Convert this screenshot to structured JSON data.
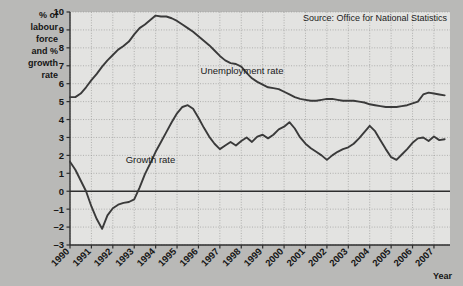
{
  "chart_data": {
    "type": "line",
    "title": "",
    "source": "Source: Office for National Statistics",
    "xlabel": "Year",
    "ylabel": "% of labour force and % growth rate",
    "ylabel_lines": [
      "% of",
      "labour",
      "force",
      "and %",
      "growth",
      "rate"
    ],
    "xlim": [
      1990,
      2007.75
    ],
    "ylim": [
      -3,
      10
    ],
    "yticks": [
      -3,
      -2,
      -1,
      0,
      1,
      2,
      3,
      4,
      5,
      6,
      7,
      8,
      9,
      10
    ],
    "ytick_labels": [
      "–3",
      "–2",
      "–1",
      "0",
      "1",
      "2",
      "3",
      "4",
      "5",
      "6",
      "7",
      "8",
      "9",
      "10"
    ],
    "xticks": [
      1990,
      1991,
      1992,
      1993,
      1994,
      1995,
      1996,
      1997,
      1998,
      1999,
      2000,
      2001,
      2002,
      2003,
      2004,
      2005,
      2006,
      2007
    ],
    "xtick_labels": [
      "1990",
      "1991",
      "1992",
      "1993",
      "1994",
      "1995",
      "1996",
      "1997",
      "1998",
      "1999",
      "2000",
      "2001",
      "2002",
      "2003",
      "2004",
      "2005",
      "2006",
      "2007"
    ],
    "grid": true,
    "grid_style": "dotted",
    "zero_line": true,
    "legend_position": "inline-annotations",
    "line_color": "#3a3a3a",
    "plot_background": "#e3e3e1",
    "page_background": "#b9b9b7",
    "series": [
      {
        "name": "Unemployment rate",
        "label_x": 1996.1,
        "label_y": 6.55,
        "x": [
          1990.0,
          1990.25,
          1990.5,
          1990.75,
          1991.0,
          1991.25,
          1991.5,
          1991.75,
          1992.0,
          1992.25,
          1992.5,
          1992.75,
          1993.0,
          1993.25,
          1993.5,
          1993.75,
          1994.0,
          1994.25,
          1994.5,
          1994.75,
          1995.0,
          1995.25,
          1995.5,
          1995.75,
          1996.0,
          1996.25,
          1996.5,
          1996.75,
          1997.0,
          1997.25,
          1997.5,
          1997.75,
          1998.0,
          1998.25,
          1998.5,
          1998.75,
          1999.0,
          1999.25,
          1999.5,
          1999.75,
          2000.0,
          2000.25,
          2000.5,
          2000.75,
          2001.0,
          2001.25,
          2001.5,
          2001.75,
          2002.0,
          2002.25,
          2002.5,
          2002.75,
          2003.0,
          2003.25,
          2003.5,
          2003.75,
          2004.0,
          2004.25,
          2004.5,
          2004.75,
          2005.0,
          2005.25,
          2005.5,
          2005.75,
          2006.0,
          2006.25,
          2006.5,
          2006.75,
          2007.0,
          2007.25,
          2007.5
        ],
        "y": [
          5.25,
          5.25,
          5.45,
          5.8,
          6.2,
          6.55,
          6.95,
          7.3,
          7.6,
          7.9,
          8.1,
          8.35,
          8.75,
          9.1,
          9.3,
          9.55,
          9.8,
          9.75,
          9.75,
          9.65,
          9.5,
          9.3,
          9.1,
          8.9,
          8.65,
          8.4,
          8.15,
          7.85,
          7.55,
          7.3,
          7.15,
          7.1,
          6.95,
          6.6,
          6.3,
          6.1,
          5.95,
          5.8,
          5.75,
          5.7,
          5.55,
          5.4,
          5.25,
          5.15,
          5.1,
          5.05,
          5.05,
          5.1,
          5.15,
          5.15,
          5.1,
          5.05,
          5.05,
          5.05,
          5.0,
          4.95,
          4.85,
          4.8,
          4.75,
          4.7,
          4.7,
          4.7,
          4.75,
          4.8,
          4.9,
          5.0,
          5.4,
          5.5,
          5.45,
          5.4,
          5.35
        ]
      },
      {
        "name": "Growth rate",
        "label_x": 1992.6,
        "label_y": 1.55,
        "x": [
          1990.0,
          1990.25,
          1990.5,
          1990.75,
          1991.0,
          1991.25,
          1991.5,
          1991.75,
          1992.0,
          1992.25,
          1992.5,
          1992.75,
          1993.0,
          1993.25,
          1993.5,
          1993.75,
          1994.0,
          1994.25,
          1994.5,
          1994.75,
          1995.0,
          1995.25,
          1995.5,
          1995.75,
          1996.0,
          1996.25,
          1996.5,
          1996.75,
          1997.0,
          1997.25,
          1997.5,
          1997.75,
          1998.0,
          1998.25,
          1998.5,
          1998.75,
          1999.0,
          1999.25,
          1999.5,
          1999.75,
          2000.0,
          2000.25,
          2000.5,
          2000.75,
          2001.0,
          2001.25,
          2001.5,
          2001.75,
          2002.0,
          2002.25,
          2002.5,
          2002.75,
          2003.0,
          2003.25,
          2003.5,
          2003.75,
          2004.0,
          2004.25,
          2004.5,
          2004.75,
          2005.0,
          2005.25,
          2005.5,
          2005.75,
          2006.0,
          2006.25,
          2006.5,
          2006.75,
          2007.0,
          2007.25,
          2007.5
        ],
        "y": [
          1.65,
          1.2,
          0.6,
          0.0,
          -0.85,
          -1.55,
          -2.1,
          -1.35,
          -0.95,
          -0.75,
          -0.65,
          -0.6,
          -0.45,
          0.2,
          0.95,
          1.55,
          2.2,
          2.75,
          3.3,
          3.85,
          4.35,
          4.7,
          4.8,
          4.6,
          4.1,
          3.55,
          3.05,
          2.65,
          2.35,
          2.55,
          2.75,
          2.55,
          2.8,
          3.0,
          2.75,
          3.05,
          3.15,
          2.95,
          3.15,
          3.45,
          3.6,
          3.85,
          3.5,
          3.0,
          2.65,
          2.4,
          2.2,
          2.0,
          1.75,
          2.0,
          2.2,
          2.35,
          2.45,
          2.65,
          2.95,
          3.3,
          3.65,
          3.35,
          2.85,
          2.35,
          1.9,
          1.75,
          2.05,
          2.35,
          2.7,
          2.95,
          3.0,
          2.8,
          3.05,
          2.85,
          2.9
        ]
      }
    ]
  }
}
